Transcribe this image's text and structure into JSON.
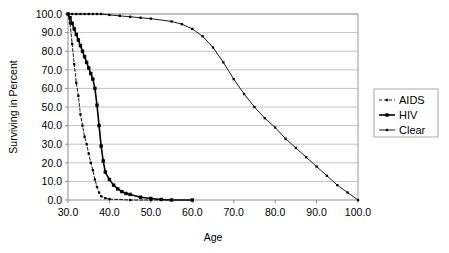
{
  "chart_data": {
    "type": "line",
    "title": "",
    "xlabel": "Age",
    "ylabel": "Surviving in Percent",
    "xlim": [
      30,
      100
    ],
    "ylim": [
      0,
      100
    ],
    "xticks": [
      "30.0",
      "40.0",
      "50.0",
      "60.0",
      "70.0",
      "80.0",
      "90.0",
      "100.0"
    ],
    "xtick_values": [
      30,
      40,
      50,
      60,
      70,
      80,
      90,
      100
    ],
    "yticks": [
      "0.0",
      "10.0",
      "20.0",
      "30.0",
      "40.0",
      "50.0",
      "60.0",
      "70.0",
      "80.0",
      "90.0",
      "100.0"
    ],
    "ytick_values": [
      0,
      10,
      20,
      30,
      40,
      50,
      60,
      70,
      80,
      90,
      100
    ],
    "grid": "horizontal",
    "legend_position": "right",
    "series": [
      {
        "name": "AIDS",
        "style": "dashed",
        "marker": "small-square",
        "color": "#000000",
        "x": [
          30,
          30.5,
          31,
          31.5,
          32,
          32.5,
          33,
          33.5,
          34,
          34.5,
          35,
          35.5,
          36,
          36.5,
          37,
          37.5,
          38,
          39,
          40,
          45,
          50,
          55
        ],
        "y": [
          100,
          95,
          84,
          73,
          63,
          56,
          46,
          40,
          34,
          30,
          25,
          20,
          16,
          11,
          7,
          4,
          2,
          1,
          0.5,
          0,
          0,
          0
        ]
      },
      {
        "name": "HIV",
        "style": "solid",
        "marker": "square",
        "color": "#000000",
        "x": [
          30,
          30.5,
          31,
          31.5,
          32,
          32.5,
          33,
          33.5,
          34,
          34.5,
          35,
          35.5,
          36,
          36.5,
          37,
          37.5,
          38,
          38.5,
          39,
          40,
          41,
          42,
          43,
          44,
          45,
          47.5,
          50,
          52.5,
          55,
          60
        ],
        "y": [
          100,
          98,
          95,
          92,
          89,
          86,
          83,
          80,
          77,
          74,
          71,
          68,
          65,
          60,
          51,
          40,
          29,
          21,
          15,
          11,
          8,
          6,
          4.5,
          3.5,
          3,
          1.5,
          0.8,
          0.3,
          0,
          0
        ]
      },
      {
        "name": "Clear",
        "style": "solid-thin",
        "marker": "small-square",
        "color": "#000000",
        "x": [
          30,
          31,
          32,
          33,
          34,
          35,
          36,
          37,
          38,
          40,
          42.5,
          45,
          47.5,
          50,
          55,
          57.5,
          60,
          62.5,
          65,
          67.5,
          70,
          72.5,
          75,
          77.5,
          80,
          82.5,
          85,
          87.5,
          90,
          92.5,
          95,
          97.5,
          100
        ],
        "y": [
          100,
          100,
          100,
          100,
          100,
          100,
          100,
          100,
          100,
          99.5,
          99,
          98.5,
          98,
          97.5,
          96,
          94.5,
          92,
          88,
          82,
          74,
          65,
          57,
          50,
          44,
          39,
          33,
          28,
          23,
          18,
          13,
          8,
          4,
          0
        ]
      }
    ]
  },
  "legend": {
    "items": [
      {
        "label": "AIDS"
      },
      {
        "label": "HIV"
      },
      {
        "label": "Clear"
      }
    ]
  }
}
